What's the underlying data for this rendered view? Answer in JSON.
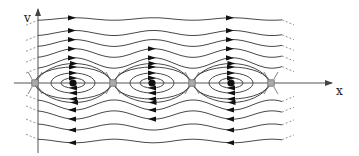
{
  "diagram": {
    "axes": {
      "x_label": "x",
      "y_label": "v"
    },
    "colors": {
      "line": "#333333",
      "axis": "#555555",
      "point": "#111111",
      "saddle_fill": "#aaaaaa",
      "dashed": "#777777"
    },
    "centers_x": [
      73,
      152,
      231
    ],
    "saddles_x": [
      35,
      113,
      192,
      271
    ],
    "axis_y": 83,
    "orbit_radii": [
      [
        12,
        5
      ],
      [
        22,
        10
      ],
      [
        32,
        16
      ]
    ],
    "upper_trajectories_offsets": [
      -20,
      -30,
      -40,
      -50,
      -64
    ],
    "lower_trajectories_offsets": [
      22,
      32,
      44,
      58
    ]
  }
}
